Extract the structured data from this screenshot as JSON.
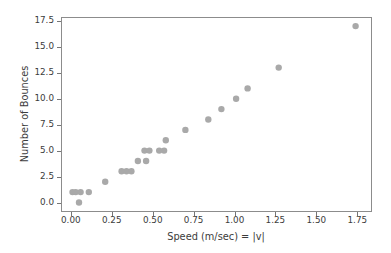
{
  "chart_data": {
    "type": "scatter",
    "title": "",
    "xlabel": "Speed (m/sec) = |v|",
    "ylabel": "Number of Bounces",
    "x": [
      0.01,
      0.03,
      0.06,
      0.11,
      0.05,
      0.21,
      0.31,
      0.34,
      0.37,
      0.41,
      0.46,
      0.45,
      0.48,
      0.54,
      0.57,
      0.58,
      0.7,
      0.84,
      0.92,
      1.01,
      1.08,
      1.27,
      1.74
    ],
    "y": [
      1,
      1,
      1,
      1,
      0,
      2,
      3,
      3,
      3,
      4,
      4,
      5,
      5,
      5,
      5,
      6,
      7,
      8,
      9,
      10,
      11,
      13,
      17
    ],
    "xlim": [
      -0.06,
      1.84
    ],
    "ylim": [
      -0.92,
      17.88
    ],
    "x_ticks": [
      0.0,
      0.25,
      0.5,
      0.75,
      1.0,
      1.25,
      1.5,
      1.75
    ],
    "x_tick_labels": [
      "0.00",
      "0.25",
      "0.50",
      "0.75",
      "1.00",
      "1.25",
      "1.50",
      "1.75"
    ],
    "y_ticks": [
      0.0,
      2.5,
      5.0,
      7.5,
      10.0,
      12.5,
      15.0,
      17.5
    ],
    "y_tick_labels": [
      "0.0",
      "2.5",
      "5.0",
      "7.5",
      "10.0",
      "12.5",
      "15.0",
      "17.5"
    ],
    "grid": false,
    "legend": null,
    "marker_color": "#a9a9a9",
    "marker_radius": 3.2,
    "spine_color": "#8c8c8c",
    "tick_color": "#767676",
    "text_color": "#3c3c3c",
    "background": "#ffffff"
  }
}
